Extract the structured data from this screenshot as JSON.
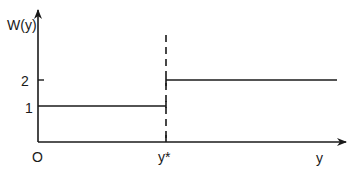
{
  "diagram": {
    "type": "step-function",
    "y_axis_label": "W(y)",
    "x_axis_label": "y",
    "origin_label": "O",
    "threshold_label": "y*",
    "y_ticks": [
      {
        "label": "1",
        "value": 1
      },
      {
        "label": "2",
        "value": 2
      }
    ],
    "segments": [
      {
        "from": "O",
        "to": "y*",
        "value": 1
      },
      {
        "from": "y*",
        "to": "beyond",
        "value": 2
      }
    ],
    "threshold_line_style": "dashed",
    "line_color": "#1a1a1a"
  }
}
